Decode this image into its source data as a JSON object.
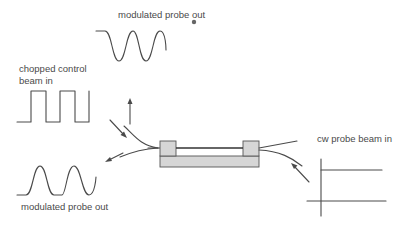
{
  "labels": {
    "top_output": "modulated probe out",
    "control_in_line1": "chopped control",
    "control_in_line2": "beam in",
    "bottom_output": "modulated probe out",
    "cw_in": "cw probe beam in"
  },
  "colors": {
    "line": "#4a4a4a",
    "device_fill": "#d6d6d6",
    "device_stroke": "#555555",
    "background": "#ffffff",
    "text": "#4a4a4a"
  },
  "icons": {
    "cursor": "mouse-pointer-dot"
  }
}
